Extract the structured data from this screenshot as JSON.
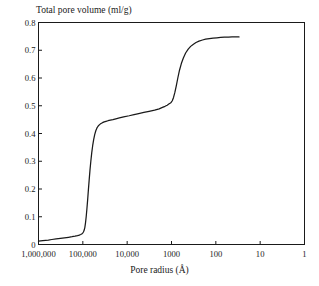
{
  "chart_data": {
    "type": "line",
    "title": "",
    "ylabel": "Total pore volume (ml/g)",
    "xlabel": "Pore radius (Å)",
    "xscale": "log",
    "x_axis_reversed": true,
    "xlim": [
      1000000,
      1
    ],
    "ylim": [
      0,
      0.8
    ],
    "grid": false,
    "legend": null,
    "x_tick_labels": [
      "1,000,000",
      "100,000",
      "10,000",
      "1000",
      "100",
      "10",
      "1"
    ],
    "x_tick_values": [
      1000000,
      100000,
      10000,
      1000,
      100,
      10,
      1
    ],
    "y_tick_labels": [
      "0.8",
      "0.7",
      "0.6",
      "0.5",
      "0.4",
      "0.3",
      "0.2",
      "0.1",
      "0"
    ],
    "y_tick_values": [
      0.8,
      0.7,
      0.6,
      0.5,
      0.4,
      0.3,
      0.2,
      0.1,
      0.0
    ],
    "series": [
      {
        "name": "Total pore volume",
        "color": "#1a1a1a",
        "x": [
          1000000,
          800000,
          600000,
          500000,
          400000,
          320000,
          260000,
          210000,
          175000,
          150000,
          132000,
          120000,
          112000,
          106000,
          101000,
          97000,
          93000,
          90000,
          87000,
          84000,
          81000,
          78000,
          75000,
          72000,
          69000,
          66000,
          63000,
          60000,
          57000,
          54000,
          51000,
          48000,
          45000,
          42000,
          39000,
          36000,
          33000,
          30000,
          27000,
          24000,
          21000,
          18000,
          15000,
          12000,
          9000,
          7000,
          5500,
          4200,
          3200,
          2400,
          1900,
          1600,
          1400,
          1250,
          1150,
          1080,
          1020,
          960,
          900,
          840,
          780,
          720,
          660,
          600,
          540,
          480,
          420,
          370,
          320,
          280,
          240,
          200,
          170,
          140,
          115,
          95,
          78,
          64,
          52,
          43,
          36,
          30
        ],
        "y": [
          0.012,
          0.014,
          0.016,
          0.018,
          0.02,
          0.022,
          0.024,
          0.026,
          0.028,
          0.03,
          0.032,
          0.034,
          0.036,
          0.038,
          0.041,
          0.045,
          0.052,
          0.062,
          0.078,
          0.1,
          0.128,
          0.16,
          0.196,
          0.232,
          0.268,
          0.3,
          0.33,
          0.356,
          0.378,
          0.396,
          0.41,
          0.42,
          0.427,
          0.432,
          0.436,
          0.439,
          0.442,
          0.444,
          0.446,
          0.448,
          0.45,
          0.453,
          0.456,
          0.46,
          0.464,
          0.468,
          0.472,
          0.476,
          0.48,
          0.484,
          0.489,
          0.494,
          0.498,
          0.502,
          0.506,
          0.509,
          0.512,
          0.518,
          0.53,
          0.548,
          0.572,
          0.6,
          0.628,
          0.652,
          0.672,
          0.69,
          0.704,
          0.714,
          0.722,
          0.728,
          0.733,
          0.737,
          0.74,
          0.742,
          0.744,
          0.745,
          0.746,
          0.747,
          0.747,
          0.748,
          0.748,
          0.748
        ]
      }
    ],
    "annotations": []
  },
  "axis": {
    "frame_color": "#1a1a1a"
  }
}
